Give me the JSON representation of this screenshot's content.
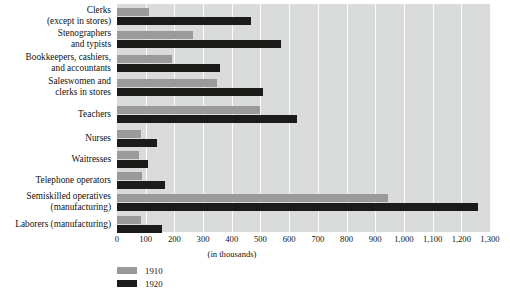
{
  "chart_data": {
    "type": "bar",
    "orientation": "horizontal",
    "title": "",
    "subtitle": "",
    "xlabel": "(in thousands)",
    "ylabel": "",
    "xlim": [
      0,
      1300
    ],
    "xticks": [
      0,
      100,
      200,
      300,
      400,
      500,
      600,
      700,
      800,
      900,
      1000,
      1100,
      1200,
      1300
    ],
    "xtick_labels": [
      "0",
      "100",
      "200",
      "300",
      "400",
      "500",
      "600",
      "700",
      "800",
      "900",
      "1,000",
      "1,100",
      "1,200",
      "1,300"
    ],
    "grid": true,
    "grid_axis": "x",
    "legend_position": "bottom-left",
    "categories": [
      "Clerks\n(except in stores)",
      "Stenographers\nand typists",
      "Bookkeepers, cashiers,\nand accountants",
      "Saleswomen and\nclerks in stores",
      "Teachers",
      "Nurses",
      "Waitresses",
      "Telephone operators",
      "Semiskilled operatives\n(manufacturing)",
      "Laborers (manufacturing)"
    ],
    "series": [
      {
        "name": "1910",
        "color": "#9a9a9a",
        "values": [
          110,
          265,
          190,
          350,
          500,
          82,
          76,
          88,
          945,
          85
        ]
      },
      {
        "name": "1920",
        "color": "#1b1b19",
        "values": [
          468,
          570,
          358,
          510,
          628,
          140,
          108,
          168,
          1258,
          158
        ]
      }
    ]
  },
  "legend": {
    "items": [
      {
        "label": "1910",
        "color": "#9a9a9a"
      },
      {
        "label": "1920",
        "color": "#1b1b19"
      }
    ]
  },
  "plot": {
    "background_color": "#d9dcda",
    "gridline_color": "#fbfbfb"
  }
}
